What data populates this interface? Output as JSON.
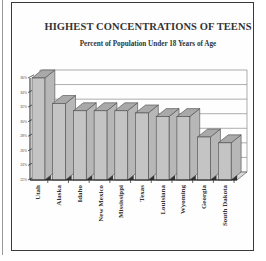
{
  "header": {
    "title": "HIGHEST CONCENTRATIONS OF TEENS",
    "subtitle": "Percent of Population Under 18 Years of Age"
  },
  "colors": {
    "bar_front": "#c4c4c4",
    "bar_top": "#a9a9a9",
    "bar_side": "#b7b7b7",
    "outline": "#4a4a4a",
    "grid": "#8a8a8a"
  },
  "chart_data": {
    "type": "bar",
    "title": "HIGHEST CONCENTRATIONS OF TEENS",
    "subtitle": "Percent of Population Under 18 Years of Age",
    "xlabel": "",
    "ylabel": "",
    "categories": [
      "Utah",
      "Alaska",
      "Idaho",
      "New Mexico",
      "Mississippi",
      "Texas",
      "Louisiana",
      "Wyoming",
      "Georgia",
      "South Dakota"
    ],
    "values": [
      36.0,
      32.5,
      31.5,
      31.5,
      31.5,
      31.2,
      30.7,
      30.7,
      27.9,
      27.1
    ],
    "ylim": [
      22,
      36
    ],
    "yticks": [
      22,
      24,
      26,
      28,
      30,
      32,
      34,
      36
    ],
    "ytick_labels": [
      "22%",
      "24%",
      "26%",
      "28%",
      "30%",
      "32%",
      "34%",
      "36%"
    ],
    "grid": true,
    "legend": null,
    "style": "3d-bar"
  }
}
